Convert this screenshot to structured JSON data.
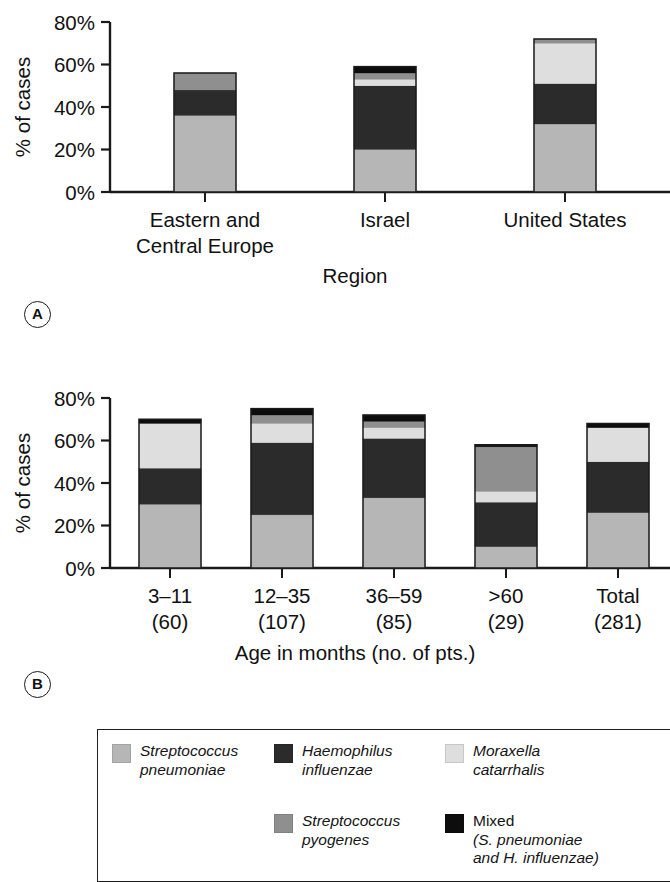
{
  "figure": {
    "panel_a_letter": "A",
    "panel_b_letter": "B"
  },
  "colors": {
    "s_pneumoniae": "#b6b6b6",
    "h_influenzae": "#2b2b2b",
    "m_catarrhalis": "#dedede",
    "s_pyogenes": "#8f8f8f",
    "mixed": "#0d0d0d",
    "axis": "#1a1a1a",
    "bar_outline": "#1a1a1a",
    "background": "#ffffff"
  },
  "legend": {
    "entries": [
      {
        "name": "S. pneumoniae",
        "label": "Streptococcus\npneumoniae",
        "color": "#b6b6b6",
        "italic": true
      },
      {
        "name": "H. influenzae",
        "label": "Haemophilus\ninfluenzae",
        "color": "#2b2b2b",
        "italic": true
      },
      {
        "name": "M. catarrhalis",
        "label": "Moraxella\ncatarrhalis",
        "color": "#dedede",
        "italic": true
      },
      {
        "name": "S. pyogenes",
        "label": "Streptococcus\npyogenes",
        "color": "#8f8f8f",
        "italic": true
      },
      {
        "name": "Mixed",
        "label": "Mixed",
        "label_line2": "(S. pneumoniae",
        "label_line3": "and H. influenzae)",
        "color": "#0d0d0d",
        "italic": false
      }
    ]
  },
  "chart_data": [
    {
      "id": "panel-a",
      "type": "bar",
      "stacked": true,
      "title": "",
      "xlabel": "Region",
      "ylabel": "% of cases",
      "ylim": [
        0,
        80
      ],
      "yticks": [
        0,
        20,
        40,
        60,
        80
      ],
      "ytick_labels": [
        "0%",
        "20%",
        "40%",
        "60%",
        "80%"
      ],
      "grid": false,
      "legend_position": "below-figure",
      "categories": [
        "Eastern and\nCentral Europe",
        "Israel",
        "United States"
      ],
      "category_labels": [
        [
          "Eastern and",
          "Central Europe"
        ],
        [
          "Israel"
        ],
        [
          "United States"
        ]
      ],
      "series": [
        {
          "name": "Streptococcus pneumoniae",
          "color": "#b6b6b6",
          "values": [
            36,
            20,
            32
          ]
        },
        {
          "name": "Haemophilus influenzae",
          "color": "#2b2b2b",
          "values": [
            12,
            30,
            19
          ]
        },
        {
          "name": "Moraxella catarrhalis",
          "color": "#dedede",
          "values": [
            0,
            3,
            19
          ]
        },
        {
          "name": "Streptococcus pyogenes",
          "color": "#8f8f8f",
          "values": [
            8,
            3,
            2
          ]
        },
        {
          "name": "Mixed (S. pneumoniae and H. influenzae)",
          "color": "#0d0d0d",
          "values": [
            0,
            3,
            0
          ]
        }
      ],
      "totals": [
        56,
        59,
        72
      ]
    },
    {
      "id": "panel-b",
      "type": "bar",
      "stacked": true,
      "title": "",
      "xlabel": "Age in months (no. of pts.)",
      "ylabel": "% of cases",
      "ylim": [
        0,
        80
      ],
      "yticks": [
        0,
        20,
        40,
        60,
        80
      ],
      "ytick_labels": [
        "0%",
        "20%",
        "40%",
        "60%",
        "80%"
      ],
      "grid": false,
      "legend_position": "below-figure",
      "categories": [
        "3–11 (60)",
        "12–35 (107)",
        "36–59 (85)",
        ">60 (29)",
        "Total (281)"
      ],
      "category_labels": [
        [
          "3–11",
          "(60)"
        ],
        [
          "12–35",
          "(107)"
        ],
        [
          "36–59",
          "(85)"
        ],
        [
          ">60",
          "(29)"
        ],
        [
          "Total",
          "(281)"
        ]
      ],
      "series": [
        {
          "name": "Streptococcus pneumoniae",
          "color": "#b6b6b6",
          "values": [
            30,
            25,
            33,
            10,
            26
          ]
        },
        {
          "name": "Haemophilus influenzae",
          "color": "#2b2b2b",
          "values": [
            17,
            34,
            28,
            21,
            24
          ]
        },
        {
          "name": "Moraxella catarrhalis",
          "color": "#dedede",
          "values": [
            21,
            9,
            5,
            5,
            16
          ]
        },
        {
          "name": "Streptococcus pyogenes",
          "color": "#8f8f8f",
          "values": [
            0,
            4,
            3,
            21,
            0
          ]
        },
        {
          "name": "Mixed (S. pneumoniae and H. influenzae)",
          "color": "#0d0d0d",
          "values": [
            2,
            3,
            3,
            1,
            2
          ]
        }
      ],
      "totals": [
        70,
        75,
        72,
        58,
        68
      ]
    }
  ]
}
